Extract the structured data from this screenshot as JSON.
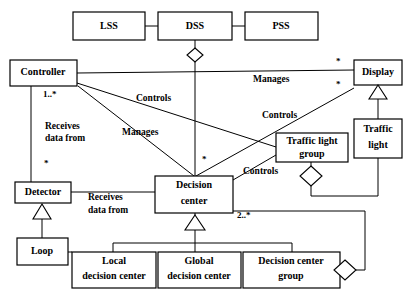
{
  "diagram": {
    "type": "uml-class-diagram",
    "classes": [
      {
        "id": "lss",
        "label": "LSS",
        "x": 73,
        "y": 12,
        "w": 72,
        "h": 28,
        "lines": [
          "LSS"
        ]
      },
      {
        "id": "dss",
        "label": "DSS",
        "x": 158,
        "y": 12,
        "w": 74,
        "h": 28,
        "lines": [
          "DSS"
        ]
      },
      {
        "id": "pss",
        "label": "PSS",
        "x": 245,
        "y": 12,
        "w": 73,
        "h": 28,
        "lines": [
          "PSS"
        ]
      },
      {
        "id": "controller",
        "label": "Controller",
        "x": 10,
        "y": 60,
        "w": 67,
        "h": 26,
        "lines": [
          "Controller"
        ]
      },
      {
        "id": "display",
        "label": "Display",
        "x": 354,
        "y": 60,
        "w": 48,
        "h": 25,
        "lines": [
          "Display"
        ]
      },
      {
        "id": "traffic-light",
        "label": "Traffic light",
        "x": 354,
        "y": 119,
        "w": 48,
        "h": 39,
        "lines": [
          "Traffic",
          "light"
        ]
      },
      {
        "id": "traffic-light-group",
        "label": "Traffic light group",
        "x": 276,
        "y": 133,
        "w": 72,
        "h": 29,
        "lines": [
          "Traffic light",
          "group"
        ]
      },
      {
        "id": "detector",
        "label": "Detector",
        "x": 15,
        "y": 182,
        "w": 56,
        "h": 21,
        "lines": [
          "Detector"
        ]
      },
      {
        "id": "decision-center",
        "label": "Decision center",
        "x": 155,
        "y": 176,
        "w": 78,
        "h": 37,
        "lines": [
          "Decision",
          "center"
        ]
      },
      {
        "id": "loop",
        "label": "Loop",
        "x": 17,
        "y": 238,
        "w": 51,
        "h": 27,
        "lines": [
          "Loop"
        ]
      },
      {
        "id": "local-decision-center",
        "label": "Local decision center",
        "x": 72,
        "y": 252,
        "w": 84,
        "h": 36,
        "lines": [
          "Local",
          "decision center"
        ]
      },
      {
        "id": "global-decision-center",
        "label": "Global decision center",
        "x": 158,
        "y": 252,
        "w": 83,
        "h": 36,
        "lines": [
          "Global",
          "decision center"
        ]
      },
      {
        "id": "decision-center-group",
        "label": "Decision center group",
        "x": 243,
        "y": 252,
        "w": 97,
        "h": 36,
        "lines": [
          "Decision center",
          "group"
        ]
      }
    ],
    "edge_labels": [
      {
        "id": "controls-left",
        "text": "Controls",
        "x": 136,
        "y": 99
      },
      {
        "id": "manages-left",
        "text": "Manages",
        "x": 122,
        "y": 133
      },
      {
        "id": "receives-data-from-upper",
        "text": "Receives",
        "x": 45,
        "y": 127
      },
      {
        "id": "receives-data-from-upper-2",
        "text": "data from",
        "x": 45,
        "y": 139
      },
      {
        "id": "manages-right",
        "text": "Manages",
        "x": 253,
        "y": 80
      },
      {
        "id": "controls-right",
        "text": "Controls",
        "x": 262,
        "y": 116
      },
      {
        "id": "controls-center",
        "text": "Controls",
        "x": 243,
        "y": 172
      },
      {
        "id": "receives-data-from-lower",
        "text": "Receives",
        "x": 88,
        "y": 198
      },
      {
        "id": "receives-data-from-lower-2",
        "text": "data from",
        "x": 88,
        "y": 211
      }
    ],
    "multiplicities": [
      {
        "id": "mult-controller-1star",
        "text": "1..*",
        "x": 43,
        "y": 95
      },
      {
        "id": "mult-display-top",
        "text": "*",
        "x": 336,
        "y": 62
      },
      {
        "id": "mult-display-bottom",
        "text": "*",
        "x": 336,
        "y": 85
      },
      {
        "id": "mult-detector-star",
        "text": "*",
        "x": 44,
        "y": 164
      },
      {
        "id": "mult-decision-center-star",
        "text": "*",
        "x": 202,
        "y": 160
      },
      {
        "id": "mult-decision-center-2star",
        "text": "2..*",
        "x": 237,
        "y": 216
      }
    ],
    "colors": {
      "background": "#ffffff",
      "stroke": "#000000",
      "fill": "#ffffff"
    }
  }
}
